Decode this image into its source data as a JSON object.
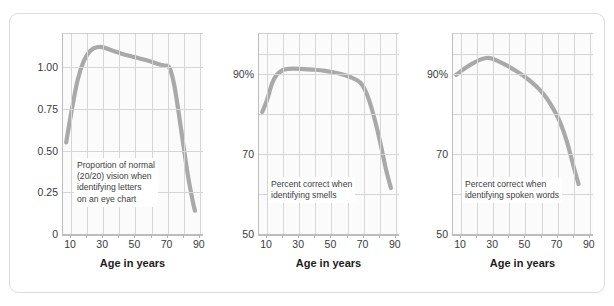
{
  "figure": {
    "curve_color": "#a9a9a9",
    "panel_bg": "#fbfbfb",
    "grid_color": "#d6d6d6",
    "frame_color": "#dcdcdc"
  },
  "chart_data": [
    {
      "type": "line",
      "id": "vision",
      "title": "",
      "annotation": "Proportion of normal\n(20/20) vision when\nidentifying letters\non an eye chart",
      "xlabel": "Age in years",
      "ylabel": "",
      "xlim": [
        5,
        92
      ],
      "ylim": [
        0,
        1.2
      ],
      "xticks": [
        10,
        30,
        50,
        70,
        90
      ],
      "xtick_labels": [
        "10",
        "30",
        "50",
        "70",
        "90"
      ],
      "yticks": [
        0,
        0.25,
        0.5,
        0.75,
        1.0
      ],
      "ytick_labels": [
        "0",
        "0.25",
        "0.50",
        "0.75",
        "1.00"
      ],
      "gridlines_x": [
        10,
        20,
        30,
        40,
        50,
        60,
        70,
        80,
        90
      ],
      "gridlines_y": [
        0.25,
        0.5,
        0.75,
        1.0
      ],
      "grid": true,
      "legend": "none",
      "x": [
        7,
        10,
        14,
        18,
        22,
        26,
        30,
        36,
        42,
        50,
        58,
        64,
        68,
        71,
        74,
        77,
        80,
        83,
        86,
        87
      ],
      "y": [
        0.55,
        0.72,
        0.92,
        1.04,
        1.1,
        1.12,
        1.12,
        1.1,
        1.08,
        1.06,
        1.04,
        1.02,
        1.01,
        1.0,
        0.9,
        0.72,
        0.52,
        0.33,
        0.18,
        0.14
      ]
    },
    {
      "type": "line",
      "id": "smell",
      "title": "",
      "annotation": "Percent correct when\nidentifying smells",
      "xlabel": "Age in years",
      "ylabel": "",
      "xlim": [
        5,
        92
      ],
      "ylim": [
        50,
        100
      ],
      "xticks": [
        10,
        30,
        50,
        70,
        90
      ],
      "xtick_labels": [
        "10",
        "30",
        "50",
        "70",
        "90"
      ],
      "yticks": [
        50,
        70,
        90
      ],
      "ytick_labels": [
        "50",
        "70",
        "90%"
      ],
      "gridlines_x": [
        10,
        20,
        30,
        40,
        50,
        60,
        70,
        80,
        90
      ],
      "gridlines_y": [
        60,
        70,
        80,
        90,
        95
      ],
      "grid": true,
      "legend": "none",
      "x": [
        7,
        10,
        13,
        16,
        20,
        24,
        30,
        38,
        46,
        54,
        62,
        68,
        72,
        76,
        80,
        84,
        87
      ],
      "y": [
        80.5,
        83.5,
        87.5,
        89.8,
        91.0,
        91.3,
        91.3,
        91.1,
        90.8,
        90.2,
        89.2,
        87.8,
        85.0,
        80.0,
        73.5,
        66.0,
        61.5
      ]
    },
    {
      "type": "line",
      "id": "hearing",
      "title": "",
      "annotation": "Percent correct when\nidentifying spoken words",
      "xlabel": "Age in years",
      "ylabel": "",
      "xlim": [
        5,
        92
      ],
      "ylim": [
        50,
        100
      ],
      "xticks": [
        10,
        30,
        50,
        70,
        90
      ],
      "xtick_labels": [
        "10",
        "30",
        "50",
        "70",
        "90"
      ],
      "yticks": [
        50,
        70,
        90
      ],
      "ytick_labels": [
        "50",
        "70",
        "90%"
      ],
      "gridlines_x": [
        10,
        20,
        30,
        40,
        50,
        60,
        70,
        80,
        90
      ],
      "gridlines_y": [
        60,
        70,
        80,
        90,
        95
      ],
      "grid": true,
      "legend": "none",
      "x": [
        7,
        12,
        17,
        22,
        26,
        29,
        33,
        38,
        44,
        50,
        56,
        62,
        68,
        72,
        76,
        80,
        83
      ],
      "y": [
        89.8,
        91.3,
        92.6,
        93.6,
        94.0,
        93.9,
        93.2,
        92.2,
        90.8,
        89.2,
        87.2,
        84.6,
        80.8,
        77.5,
        72.8,
        66.8,
        62.5
      ]
    }
  ]
}
